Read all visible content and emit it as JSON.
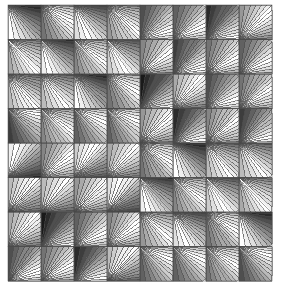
{
  "artwork": {
    "title": "Grayscale Ray-Fan Tiling",
    "description": "An 8 by 8 grid of square tiles. Each tile is filled with a fan of straight-edged rays radiating from one corner of the tile, shaded in bands of grayscale from black through mid grays to white. Quadrants of the grid differ in the corner the fan radiates from, producing a woven, checkerboard-like texture.",
    "type": "geometric-pattern",
    "background_color": "#ffffff",
    "stroke_color": "#4a4a4a",
    "stroke_width": 0.5,
    "canvas": {
      "width": 285,
      "height": 295
    },
    "plot_area": {
      "x": 8,
      "y": 5,
      "width": 264,
      "height": 276
    },
    "grid": {
      "columns": 8,
      "rows": 8,
      "tile_width": 33.0,
      "tile_height": 34.5
    },
    "palette": [
      "#1a1a1a",
      "#2b2b2b",
      "#3d3d3d",
      "#4f4f4f",
      "#616161",
      "#737373",
      "#858585",
      "#979797",
      "#a9a9a9",
      "#bbbbbb",
      "#cdcdcd",
      "#dfdfdf",
      "#f0f0f0",
      "#ffffff"
    ],
    "ray_counts": [
      13,
      14,
      15,
      16
    ],
    "quadrants": [
      {
        "name": "top-left",
        "cols": [
          0,
          3
        ],
        "rows": [
          0,
          3
        ],
        "origin_corner": "top-left",
        "sweep": "shallow"
      },
      {
        "name": "top-right",
        "cols": [
          4,
          7
        ],
        "rows": [
          0,
          3
        ],
        "origin_corner": "bottom-left",
        "sweep": "steep"
      },
      {
        "name": "bottom-left",
        "cols": [
          0,
          3
        ],
        "rows": [
          4,
          7
        ],
        "origin_corner": "bottom-left",
        "sweep": "steep"
      },
      {
        "name": "bottom-right",
        "cols": [
          4,
          7
        ],
        "rows": [
          4,
          7
        ],
        "origin_corner": "top-left",
        "sweep": "shallow"
      }
    ]
  },
  "chart_data": {
    "type": "heatmap",
    "xlabel": "",
    "ylabel": "",
    "categories": [
      "c1",
      "c2",
      "c3",
      "c4",
      "c5",
      "c6",
      "c7",
      "c8"
    ],
    "rows": [
      "r1",
      "r2",
      "r3",
      "r4",
      "r5",
      "r6",
      "r7",
      "r8"
    ],
    "legend": [],
    "grid": true,
    "tiles": [
      [
        {
          "corner": "tl",
          "dir": "cw",
          "phase": 0,
          "rays": 14,
          "flip": false
        },
        {
          "corner": "tl",
          "dir": "cw",
          "phase": 5,
          "rays": 15,
          "flip": true
        },
        {
          "corner": "tl",
          "dir": "cw",
          "phase": 2,
          "rays": 14,
          "flip": false
        },
        {
          "corner": "tl",
          "dir": "cw",
          "phase": 7,
          "rays": 16,
          "flip": true
        },
        {
          "corner": "bl",
          "dir": "ccw",
          "phase": 3,
          "rays": 15,
          "flip": true
        },
        {
          "corner": "bl",
          "dir": "ccw",
          "phase": 9,
          "rays": 14,
          "flip": false
        },
        {
          "corner": "bl",
          "dir": "ccw",
          "phase": 1,
          "rays": 16,
          "flip": true
        },
        {
          "corner": "bl",
          "dir": "ccw",
          "phase": 6,
          "rays": 15,
          "flip": false
        }
      ],
      [
        {
          "corner": "tl",
          "dir": "cw",
          "phase": 8,
          "rays": 15,
          "flip": true
        },
        {
          "corner": "tl",
          "dir": "cw",
          "phase": 1,
          "rays": 14,
          "flip": false
        },
        {
          "corner": "tl",
          "dir": "cw",
          "phase": 6,
          "rays": 16,
          "flip": true
        },
        {
          "corner": "tl",
          "dir": "cw",
          "phase": 3,
          "rays": 14,
          "flip": false
        },
        {
          "corner": "bl",
          "dir": "ccw",
          "phase": 7,
          "rays": 14,
          "flip": false
        },
        {
          "corner": "bl",
          "dir": "ccw",
          "phase": 2,
          "rays": 16,
          "flip": true
        },
        {
          "corner": "bl",
          "dir": "ccw",
          "phase": 8,
          "rays": 15,
          "flip": false
        },
        {
          "corner": "bl",
          "dir": "ccw",
          "phase": 4,
          "rays": 14,
          "flip": true
        }
      ],
      [
        {
          "corner": "tl",
          "dir": "cw",
          "phase": 4,
          "rays": 16,
          "flip": false
        },
        {
          "corner": "tl",
          "dir": "cw",
          "phase": 9,
          "rays": 14,
          "flip": true
        },
        {
          "corner": "tl",
          "dir": "cw",
          "phase": 0,
          "rays": 15,
          "flip": false
        },
        {
          "corner": "tl",
          "dir": "cw",
          "phase": 5,
          "rays": 14,
          "flip": true
        },
        {
          "corner": "bl",
          "dir": "ccw",
          "phase": 0,
          "rays": 16,
          "flip": true
        },
        {
          "corner": "bl",
          "dir": "ccw",
          "phase": 5,
          "rays": 15,
          "flip": false
        },
        {
          "corner": "bl",
          "dir": "ccw",
          "phase": 3,
          "rays": 14,
          "flip": true
        },
        {
          "corner": "bl",
          "dir": "ccw",
          "phase": 8,
          "rays": 16,
          "flip": false
        }
      ],
      [
        {
          "corner": "tl",
          "dir": "cw",
          "phase": 2,
          "rays": 15,
          "flip": true
        },
        {
          "corner": "tl",
          "dir": "cw",
          "phase": 7,
          "rays": 16,
          "flip": false
        },
        {
          "corner": "tl",
          "dir": "cw",
          "phase": 4,
          "rays": 14,
          "flip": true
        },
        {
          "corner": "tl",
          "dir": "cw",
          "phase": 9,
          "rays": 15,
          "flip": false
        },
        {
          "corner": "bl",
          "dir": "ccw",
          "phase": 6,
          "rays": 15,
          "flip": false
        },
        {
          "corner": "bl",
          "dir": "ccw",
          "phase": 1,
          "rays": 14,
          "flip": true
        },
        {
          "corner": "bl",
          "dir": "ccw",
          "phase": 7,
          "rays": 16,
          "flip": false
        },
        {
          "corner": "bl",
          "dir": "ccw",
          "phase": 2,
          "rays": 15,
          "flip": true
        }
      ],
      [
        {
          "corner": "bl",
          "dir": "ccw",
          "phase": 1,
          "rays": 14,
          "flip": false
        },
        {
          "corner": "bl",
          "dir": "ccw",
          "phase": 6,
          "rays": 15,
          "flip": true
        },
        {
          "corner": "bl",
          "dir": "ccw",
          "phase": 3,
          "rays": 16,
          "flip": false
        },
        {
          "corner": "bl",
          "dir": "ccw",
          "phase": 8,
          "rays": 14,
          "flip": true
        },
        {
          "corner": "tl",
          "dir": "cw",
          "phase": 5,
          "rays": 16,
          "flip": true
        },
        {
          "corner": "tl",
          "dir": "cw",
          "phase": 0,
          "rays": 14,
          "flip": false
        },
        {
          "corner": "tl",
          "dir": "cw",
          "phase": 9,
          "rays": 15,
          "flip": true
        },
        {
          "corner": "tl",
          "dir": "cw",
          "phase": 4,
          "rays": 14,
          "flip": false
        }
      ],
      [
        {
          "corner": "bl",
          "dir": "ccw",
          "phase": 9,
          "rays": 16,
          "flip": true
        },
        {
          "corner": "bl",
          "dir": "ccw",
          "phase": 4,
          "rays": 14,
          "flip": false
        },
        {
          "corner": "bl",
          "dir": "ccw",
          "phase": 7,
          "rays": 15,
          "flip": true
        },
        {
          "corner": "bl",
          "dir": "ccw",
          "phase": 2,
          "rays": 16,
          "flip": false
        },
        {
          "corner": "tl",
          "dir": "cw",
          "phase": 1,
          "rays": 15,
          "flip": false
        },
        {
          "corner": "tl",
          "dir": "cw",
          "phase": 6,
          "rays": 16,
          "flip": true
        },
        {
          "corner": "tl",
          "dir": "cw",
          "phase": 3,
          "rays": 14,
          "flip": false
        },
        {
          "corner": "tl",
          "dir": "cw",
          "phase": 8,
          "rays": 15,
          "flip": true
        }
      ],
      [
        {
          "corner": "bl",
          "dir": "ccw",
          "phase": 5,
          "rays": 15,
          "flip": false
        },
        {
          "corner": "bl",
          "dir": "ccw",
          "phase": 0,
          "rays": 16,
          "flip": true
        },
        {
          "corner": "bl",
          "dir": "ccw",
          "phase": 9,
          "rays": 14,
          "flip": false
        },
        {
          "corner": "bl",
          "dir": "ccw",
          "phase": 6,
          "rays": 15,
          "flip": true
        },
        {
          "corner": "tl",
          "dir": "cw",
          "phase": 7,
          "rays": 14,
          "flip": true
        },
        {
          "corner": "tl",
          "dir": "cw",
          "phase": 2,
          "rays": 15,
          "flip": false
        },
        {
          "corner": "tl",
          "dir": "cw",
          "phase": 5,
          "rays": 16,
          "flip": true
        },
        {
          "corner": "tl",
          "dir": "cw",
          "phase": 0,
          "rays": 14,
          "flip": false
        }
      ],
      [
        {
          "corner": "bl",
          "dir": "ccw",
          "phase": 3,
          "rays": 16,
          "flip": true
        },
        {
          "corner": "bl",
          "dir": "ccw",
          "phase": 8,
          "rays": 15,
          "flip": false
        },
        {
          "corner": "bl",
          "dir": "ccw",
          "phase": 1,
          "rays": 14,
          "flip": true
        },
        {
          "corner": "bl",
          "dir": "ccw",
          "phase": 4,
          "rays": 16,
          "flip": false
        },
        {
          "corner": "tl",
          "dir": "cw",
          "phase": 9,
          "rays": 15,
          "flip": false
        },
        {
          "corner": "tl",
          "dir": "cw",
          "phase": 4,
          "rays": 14,
          "flip": true
        },
        {
          "corner": "tl",
          "dir": "cw",
          "phase": 8,
          "rays": 16,
          "flip": false
        },
        {
          "corner": "tl",
          "dir": "cw",
          "phase": 3,
          "rays": 15,
          "flip": true
        }
      ]
    ]
  }
}
